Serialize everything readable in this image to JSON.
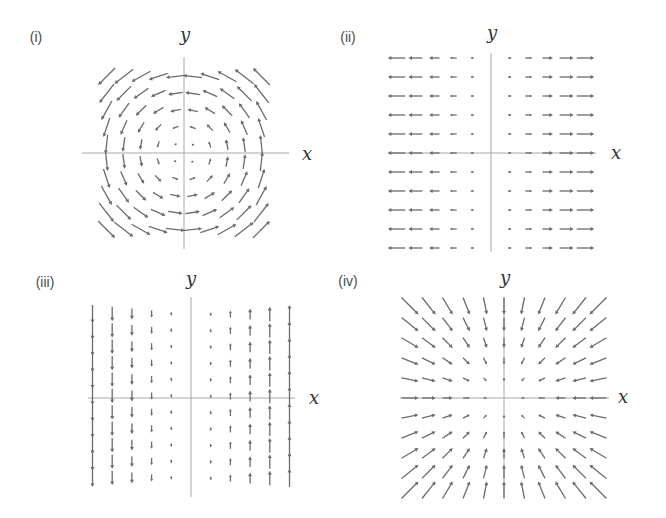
{
  "colors": {
    "arrow": "#6b6b6b",
    "axis": "#a8a8a8",
    "label": "#4a4a4a"
  },
  "panels": [
    {
      "id": "i",
      "label": "(i)",
      "x_label": "x",
      "y_label": "y",
      "field": "(-y, x)",
      "description": "counter-clockwise rotational field"
    },
    {
      "id": "ii",
      "label": "(ii)",
      "x_label": "x",
      "y_label": "y",
      "field": "(x, 0)",
      "description": "horizontal field pointing away from y-axis"
    },
    {
      "id": "iii",
      "label": "(iii)",
      "x_label": "x",
      "y_label": "y",
      "field": "(0, x)",
      "description": "vertical field: up for x>0, down for x<0"
    },
    {
      "id": "iv",
      "label": "(iv)",
      "x_label": "x",
      "y_label": "y",
      "field": "(-x, -y)",
      "description": "radial field pointing toward origin"
    }
  ],
  "chart_data": [
    {
      "type": "vector_field",
      "title": "(i)",
      "xlabel": "x",
      "ylabel": "y",
      "field": {
        "u": "-y",
        "v": "x"
      },
      "grid": {
        "x": [
          -4.5,
          -3.5,
          -2.5,
          -1.5,
          -0.5,
          0.5,
          1.5,
          2.5,
          3.5,
          4.5
        ],
        "y": [
          -4.5,
          -3.5,
          -2.5,
          -1.5,
          -0.5,
          0.5,
          1.5,
          2.5,
          3.5,
          4.5
        ]
      }
    },
    {
      "type": "vector_field",
      "title": "(ii)",
      "xlabel": "x",
      "ylabel": "y",
      "field": {
        "u": "x",
        "v": "0"
      },
      "grid": {
        "x": [
          -5,
          -4,
          -3,
          -2,
          -1,
          1,
          2,
          3,
          4,
          5
        ],
        "y": [
          -5,
          -4,
          -3,
          -2,
          -1,
          0,
          1,
          2,
          3,
          4,
          5
        ]
      }
    },
    {
      "type": "vector_field",
      "title": "(iii)",
      "xlabel": "x",
      "ylabel": "y",
      "field": {
        "u": "0",
        "v": "x"
      },
      "grid": {
        "x": [
          -5,
          -4,
          -3,
          -2,
          -1,
          1,
          2,
          3,
          4,
          5
        ],
        "y": [
          -5,
          -4,
          -3,
          -2,
          -1,
          0,
          1,
          2,
          3,
          4,
          5
        ]
      }
    },
    {
      "type": "vector_field",
      "title": "(iv)",
      "xlabel": "x",
      "ylabel": "y",
      "field": {
        "u": "-x",
        "v": "-y"
      },
      "grid": {
        "x": [
          -5,
          -4,
          -3,
          -2,
          -1,
          0,
          1,
          2,
          3,
          4,
          5
        ],
        "y": [
          -5,
          -4,
          -3,
          -2,
          -1,
          0,
          1,
          2,
          3,
          4,
          5
        ]
      }
    }
  ]
}
